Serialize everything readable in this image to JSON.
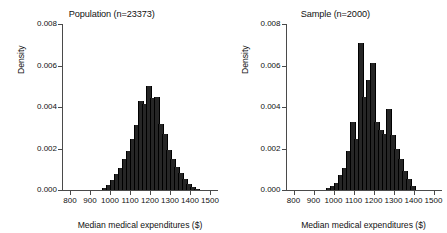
{
  "figure": {
    "background": "#ffffff",
    "bar_color": "#262626",
    "axis_color": "#4a4a4a"
  },
  "axis": {
    "x_title": "Median medical expenditures ($)",
    "y_title": "Density",
    "x_ticks": [
      800,
      900,
      1000,
      1100,
      1200,
      1300,
      1400,
      1500
    ],
    "y_ticks": [
      "0.000",
      "0.002",
      "0.004",
      "0.006",
      "0.008"
    ],
    "y_tick_values": [
      0.0,
      0.002,
      0.004,
      0.006,
      0.008
    ],
    "xlim": [
      760,
      1540
    ],
    "ylim": [
      0,
      0.008
    ]
  },
  "panels": [
    {
      "id": "population",
      "title": "Population (n=23373)"
    },
    {
      "id": "sample",
      "title": "Sample (n=2000)"
    }
  ],
  "chart_data": [
    {
      "type": "bar",
      "title": "Population (n=23373)",
      "xlabel": "Median medical expenditures ($)",
      "ylabel": "Density",
      "xlim": [
        760,
        1540
      ],
      "ylim": [
        0,
        0.008
      ],
      "grid": false,
      "legend": "none",
      "bin_width": 20,
      "x": [
        970,
        990,
        1010,
        1030,
        1050,
        1070,
        1090,
        1110,
        1130,
        1150,
        1170,
        1190,
        1210,
        1230,
        1250,
        1270,
        1290,
        1310,
        1330,
        1350,
        1370,
        1390,
        1410,
        1430
      ],
      "values": [
        0.0001,
        0.00022,
        0.00048,
        0.00075,
        0.00108,
        0.0015,
        0.0019,
        0.00245,
        0.00315,
        0.0043,
        0.00415,
        0.005,
        0.00445,
        0.0045,
        0.0032,
        0.0027,
        0.00195,
        0.0015,
        0.00112,
        0.0008,
        0.00052,
        0.0003,
        0.00015,
        6e-05
      ]
    },
    {
      "type": "bar",
      "title": "Sample (n=2000)",
      "xlabel": "Median medical expenditures ($)",
      "ylabel": "Density",
      "xlim": [
        760,
        1540
      ],
      "ylim": [
        0,
        0.008
      ],
      "grid": false,
      "legend": "none",
      "bin_width": 20,
      "x": [
        970,
        990,
        1010,
        1030,
        1050,
        1070,
        1090,
        1110,
        1130,
        1150,
        1170,
        1190,
        1210,
        1230,
        1250,
        1270,
        1290,
        1310,
        1330,
        1350,
        1370,
        1390
      ],
      "values": [
        0.0001,
        0.0002,
        0.00035,
        0.0007,
        0.00105,
        0.0019,
        0.0033,
        0.00245,
        0.0071,
        0.0045,
        0.0053,
        0.0061,
        0.0033,
        0.0029,
        0.0027,
        0.0039,
        0.00265,
        0.002,
        0.0015,
        0.0009,
        0.00055,
        0.0002
      ]
    }
  ]
}
